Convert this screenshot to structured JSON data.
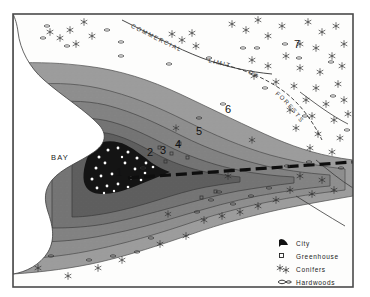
{
  "map": {
    "title": "Land Use Zone Map",
    "water_label": "BAY",
    "zone_labels": [
      "1",
      "2",
      "3",
      "4",
      "5",
      "6",
      "7"
    ],
    "route_labels": {
      "commercial": "COMMERCIAL",
      "limit": "LIMIT",
      "of": "OF",
      "forests": "FORESTS"
    },
    "colors": {
      "core_city": "#141414",
      "zone2": "#5a5a5a",
      "zone3": "#6e6e6e",
      "zone4": "#828282",
      "zone5": "#8e8e8e",
      "zone6": "#9a9a9a",
      "background": "#ffffff",
      "frame": "#4a4a4a",
      "line": "#3a3a3a",
      "road": "#111111"
    }
  },
  "legend": {
    "items": [
      {
        "symbol": "city-marker",
        "label": "City"
      },
      {
        "symbol": "greenhouse-square",
        "label": "Greenhouse"
      },
      {
        "symbol": "conifer-star",
        "label": "Conifers"
      },
      {
        "symbol": "hardwood-blob",
        "label": "Hardwoods"
      }
    ]
  }
}
